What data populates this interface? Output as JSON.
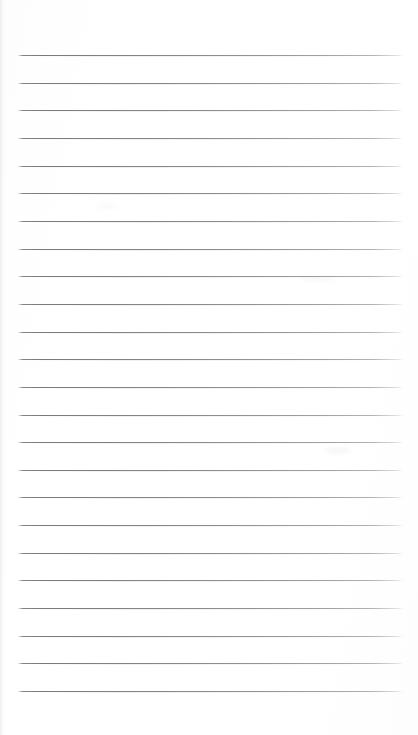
{
  "document": {
    "type": "scanned-ruled-notepaper",
    "title": "Blank ruled notepaper scan",
    "page_width": 418,
    "page_height": 735,
    "background_color": "#fefefe",
    "has_text_content": false,
    "has_header": false,
    "has_margin_rule": false,
    "orientation": "portrait"
  },
  "ruling": {
    "line_count": 24,
    "line_color": "#83858b",
    "line_color_faded_right": "#b4b6bc",
    "line_thickness_px": 1,
    "first_line_y": 55,
    "line_spacing_px": 27.65,
    "line_left_x": 18,
    "line_right_x": 403,
    "line_width_px": 385,
    "top_margin_px": 55,
    "bottom_margin_px": 44,
    "left_margin_px": 18,
    "right_margin_px": 15,
    "lines_y": [
      55,
      82.7,
      110.3,
      138,
      165.6,
      193.3,
      220.9,
      248.6,
      276.2,
      303.9,
      331.5,
      359.2,
      386.8,
      414.5,
      442.1,
      469.8,
      497.4,
      525.1,
      552.7,
      580.4,
      608,
      635.7,
      663.3,
      691
    ]
  },
  "artifacts": {
    "scan_edge_shadow_left": true,
    "smudges": [
      {
        "x": 325,
        "y": 448,
        "width": 26,
        "height": 5,
        "opacity": 0.1
      },
      {
        "x": 300,
        "y": 277,
        "width": 34,
        "height": 4,
        "opacity": 0.08
      },
      {
        "x": 96,
        "y": 204,
        "width": 22,
        "height": 4,
        "opacity": 0.07
      }
    ]
  }
}
